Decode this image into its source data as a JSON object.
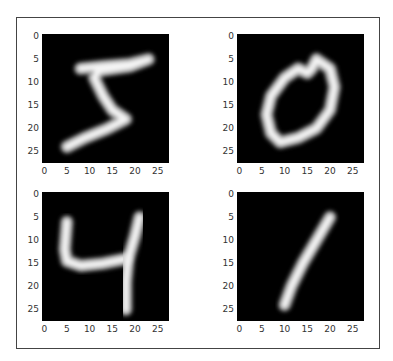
{
  "chart_data": [
    {
      "type": "heatmap",
      "title": "",
      "subplot": "top-left",
      "digit_label": "5",
      "colormap": "gray",
      "image_size": [
        28,
        28
      ],
      "xlabel": "",
      "ylabel": "",
      "xticks": [
        0,
        5,
        10,
        15,
        20,
        25
      ],
      "yticks": [
        0,
        5,
        10,
        15,
        20,
        25
      ],
      "xlim": [
        -0.5,
        27.5
      ],
      "ylim": [
        27.5,
        -0.5
      ],
      "stroke_path_units": [
        [
          8,
          7
        ],
        [
          13,
          6.5
        ],
        [
          19,
          6
        ],
        [
          23,
          5
        ],
        [
          19,
          6.5
        ],
        [
          12,
          7.5
        ],
        [
          11,
          9
        ],
        [
          13,
          13
        ],
        [
          15,
          16
        ],
        [
          18,
          18
        ],
        [
          14,
          20
        ],
        [
          9,
          22
        ],
        [
          5,
          24
        ]
      ]
    },
    {
      "type": "heatmap",
      "title": "",
      "subplot": "top-right",
      "digit_label": "0",
      "colormap": "gray",
      "image_size": [
        28,
        28
      ],
      "xlabel": "",
      "ylabel": "",
      "xticks": [
        0,
        5,
        10,
        15,
        20,
        25
      ],
      "yticks": [
        0,
        5,
        10,
        15,
        20,
        25
      ],
      "xlim": [
        -0.5,
        27.5
      ],
      "ylim": [
        27.5,
        -0.5
      ],
      "stroke_path_units": [
        [
          17,
          5
        ],
        [
          20,
          7
        ],
        [
          21,
          11
        ],
        [
          20,
          16
        ],
        [
          17,
          20
        ],
        [
          13,
          22
        ],
        [
          9,
          23
        ],
        [
          7,
          21
        ],
        [
          6,
          17
        ],
        [
          7,
          13
        ],
        [
          10,
          9
        ],
        [
          13,
          7
        ],
        [
          15,
          8
        ],
        [
          16,
          7
        ],
        [
          17,
          5
        ]
      ]
    },
    {
      "type": "heatmap",
      "title": "",
      "subplot": "bottom-left",
      "digit_label": "4",
      "colormap": "gray",
      "image_size": [
        28,
        28
      ],
      "xlabel": "",
      "ylabel": "",
      "xticks": [
        0,
        5,
        10,
        15,
        20,
        25
      ],
      "yticks": [
        0,
        5,
        10,
        15,
        20,
        25
      ],
      "xlim": [
        -0.5,
        27.5
      ],
      "ylim": [
        27.5,
        -0.5
      ],
      "stroke_path_units": [
        [
          [
            5,
            6
          ],
          [
            4.5,
            12
          ],
          [
            5,
            14.5
          ],
          [
            8,
            15.5
          ],
          [
            13,
            15
          ],
          [
            18,
            14
          ]
        ],
        [
          [
            21,
            5
          ],
          [
            20,
            9
          ],
          [
            18.5,
            14
          ],
          [
            18,
            19
          ],
          [
            18,
            25
          ]
        ]
      ]
    },
    {
      "type": "heatmap",
      "title": "",
      "subplot": "bottom-right",
      "digit_label": "1",
      "colormap": "gray",
      "image_size": [
        28,
        28
      ],
      "xlabel": "",
      "ylabel": "",
      "xticks": [
        0,
        5,
        10,
        15,
        20,
        25
      ],
      "yticks": [
        0,
        5,
        10,
        15,
        20,
        25
      ],
      "xlim": [
        -0.5,
        27.5
      ],
      "ylim": [
        27.5,
        -0.5
      ],
      "stroke_path_units": [
        [
          20,
          5
        ],
        [
          17,
          10
        ],
        [
          14,
          15
        ],
        [
          11.5,
          20
        ],
        [
          10,
          24
        ]
      ]
    }
  ],
  "ticks": {
    "labels": [
      "0",
      "5",
      "10",
      "15",
      "20",
      "25"
    ]
  }
}
